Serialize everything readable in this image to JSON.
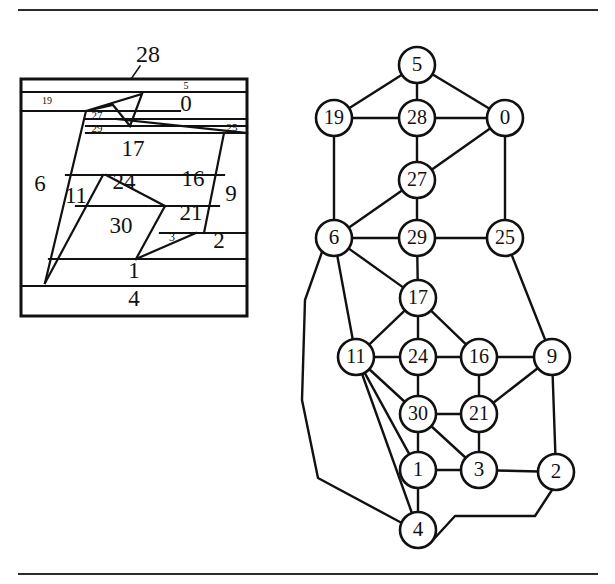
{
  "figure": {
    "rules": {
      "top_label": "top-horizontal-rule",
      "bottom_label": "bottom-horizontal-rule"
    }
  },
  "map": {
    "name": "rectangular-dual-map",
    "frame": {
      "x": 20,
      "y": 78,
      "width": 228,
      "height": 238
    },
    "external_label": {
      "text": "28",
      "x": 148,
      "y": 55
    },
    "leader_line": {
      "from_x": 140,
      "from_y": 66,
      "to_x": 113,
      "to_y": 105
    },
    "regions": [
      {
        "id": "19",
        "label": "19",
        "label_x": 47,
        "label_y": 100,
        "size": "small"
      },
      {
        "id": "5",
        "label": "5",
        "label_x": 186,
        "label_y": 88,
        "size": "small"
      },
      {
        "id": "0",
        "label": "0",
        "label_x": 186,
        "label_y": 104,
        "size": "large"
      },
      {
        "id": "28",
        "label": "28",
        "label_x": 148,
        "label_y": 55,
        "size": "external"
      },
      {
        "id": "27",
        "label": "27",
        "label_x": 94,
        "label_y": 114,
        "size": "small"
      },
      {
        "id": "29",
        "label": "29",
        "label_x": 96,
        "label_y": 127,
        "size": "small"
      },
      {
        "id": "25",
        "label": "25",
        "label_x": 231,
        "label_y": 126,
        "size": "small"
      },
      {
        "id": "17",
        "label": "17",
        "label_x": 133,
        "label_y": 148,
        "size": "large"
      },
      {
        "id": "6",
        "label": "6",
        "label_x": 40,
        "label_y": 184,
        "size": "large"
      },
      {
        "id": "11",
        "label": "11",
        "label_x": 75,
        "label_y": 196,
        "size": "large"
      },
      {
        "id": "24",
        "label": "24",
        "label_x": 123,
        "label_y": 182,
        "size": "large"
      },
      {
        "id": "16",
        "label": "16",
        "label_x": 192,
        "label_y": 180,
        "size": "large"
      },
      {
        "id": "9",
        "label": "9",
        "label_x": 231,
        "label_y": 194,
        "size": "large"
      },
      {
        "id": "21",
        "label": "21",
        "label_x": 191,
        "label_y": 212,
        "size": "large"
      },
      {
        "id": "30",
        "label": "30",
        "label_x": 121,
        "label_y": 226,
        "size": "large"
      },
      {
        "id": "3",
        "label": "3",
        "label_x": 172,
        "label_y": 235,
        "size": "small"
      },
      {
        "id": "2",
        "label": "2",
        "label_x": 219,
        "label_y": 240,
        "size": "large"
      },
      {
        "id": "1",
        "label": "1",
        "label_x": 134,
        "label_y": 271,
        "size": "large"
      },
      {
        "id": "4",
        "label": "4",
        "label_x": 134,
        "label_y": 298,
        "size": "large"
      }
    ]
  },
  "graph": {
    "name": "planar-adjacency-graph",
    "node_radius": 18,
    "nodes": [
      {
        "id": "5",
        "label": "5",
        "x": 417,
        "y": 65
      },
      {
        "id": "19",
        "label": "19",
        "x": 334,
        "y": 118
      },
      {
        "id": "28",
        "label": "28",
        "x": 417,
        "y": 118
      },
      {
        "id": "0",
        "label": "0",
        "x": 505,
        "y": 118
      },
      {
        "id": "27",
        "label": "27",
        "x": 417,
        "y": 180
      },
      {
        "id": "6",
        "label": "6",
        "x": 334,
        "y": 238
      },
      {
        "id": "29",
        "label": "29",
        "x": 417,
        "y": 238
      },
      {
        "id": "25",
        "label": "25",
        "x": 505,
        "y": 238
      },
      {
        "id": "17",
        "label": "17",
        "x": 418,
        "y": 298
      },
      {
        "id": "11",
        "label": "11",
        "x": 356,
        "y": 357
      },
      {
        "id": "24",
        "label": "24",
        "x": 418,
        "y": 357
      },
      {
        "id": "16",
        "label": "16",
        "x": 479,
        "y": 357
      },
      {
        "id": "9",
        "label": "9",
        "x": 552,
        "y": 357
      },
      {
        "id": "30",
        "label": "30",
        "x": 418,
        "y": 414
      },
      {
        "id": "21",
        "label": "21",
        "x": 479,
        "y": 414
      },
      {
        "id": "1",
        "label": "1",
        "x": 418,
        "y": 470
      },
      {
        "id": "3",
        "label": "3",
        "x": 479,
        "y": 470
      },
      {
        "id": "2",
        "label": "2",
        "x": 556,
        "y": 472
      },
      {
        "id": "4",
        "label": "4",
        "x": 418,
        "y": 530
      }
    ],
    "edges": [
      {
        "from": "5",
        "to": "19"
      },
      {
        "from": "5",
        "to": "28"
      },
      {
        "from": "5",
        "to": "0"
      },
      {
        "from": "19",
        "to": "28"
      },
      {
        "from": "28",
        "to": "0"
      },
      {
        "from": "19",
        "to": "6"
      },
      {
        "from": "28",
        "to": "27"
      },
      {
        "from": "0",
        "to": "27"
      },
      {
        "from": "0",
        "to": "25"
      },
      {
        "from": "27",
        "to": "6"
      },
      {
        "from": "27",
        "to": "29"
      },
      {
        "from": "6",
        "to": "29"
      },
      {
        "from": "29",
        "to": "25"
      },
      {
        "from": "29",
        "to": "17"
      },
      {
        "from": "6",
        "to": "17"
      },
      {
        "from": "25",
        "to": "9"
      },
      {
        "from": "6",
        "to": "11"
      },
      {
        "from": "17",
        "to": "11"
      },
      {
        "from": "17",
        "to": "24"
      },
      {
        "from": "17",
        "to": "16"
      },
      {
        "from": "11",
        "to": "24"
      },
      {
        "from": "24",
        "to": "16"
      },
      {
        "from": "16",
        "to": "9"
      },
      {
        "from": "11",
        "to": "30"
      },
      {
        "from": "24",
        "to": "30"
      },
      {
        "from": "16",
        "to": "21"
      },
      {
        "from": "30",
        "to": "21"
      },
      {
        "from": "21",
        "to": "9"
      },
      {
        "from": "9",
        "to": "2"
      },
      {
        "from": "11",
        "to": "1"
      },
      {
        "from": "30",
        "to": "1"
      },
      {
        "from": "30",
        "to": "3"
      },
      {
        "from": "21",
        "to": "3"
      },
      {
        "from": "1",
        "to": "3"
      },
      {
        "from": "3",
        "to": "2"
      },
      {
        "from": "11",
        "to": "4"
      },
      {
        "from": "1",
        "to": "4"
      }
    ],
    "poly_edges": [
      {
        "from": "6",
        "to": "4",
        "points": "322,252 305,300 302,400 318,478 400,522"
      },
      {
        "from": "4",
        "to": "2",
        "points": "433,540 455,516 535,516 552,490"
      }
    ]
  }
}
